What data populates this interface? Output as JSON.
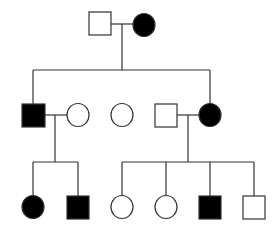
{
  "diagram": {
    "type": "pedigree",
    "colors": {
      "affected": "#000000",
      "unaffected": "#ffffff",
      "stroke": "#333333"
    },
    "generations": [
      {
        "label": "I",
        "members": [
          {
            "id": "I-1",
            "sex": "male",
            "affected": false
          },
          {
            "id": "I-2",
            "sex": "female",
            "affected": true
          }
        ]
      },
      {
        "label": "II",
        "members": [
          {
            "id": "II-1",
            "sex": "male",
            "affected": true
          },
          {
            "id": "II-2",
            "sex": "female",
            "affected": false,
            "spouse_of": "II-1"
          },
          {
            "id": "II-3",
            "sex": "female",
            "affected": false
          },
          {
            "id": "II-4",
            "sex": "male",
            "affected": false,
            "spouse_of": "II-5"
          },
          {
            "id": "II-5",
            "sex": "female",
            "affected": true
          }
        ]
      },
      {
        "label": "III",
        "members": [
          {
            "id": "III-1",
            "sex": "female",
            "affected": true,
            "parents": [
              "II-1",
              "II-2"
            ]
          },
          {
            "id": "III-2",
            "sex": "male",
            "affected": true,
            "parents": [
              "II-1",
              "II-2"
            ]
          },
          {
            "id": "III-3",
            "sex": "female",
            "affected": false,
            "parents": [
              "II-4",
              "II-5"
            ]
          },
          {
            "id": "III-4",
            "sex": "female",
            "affected": false,
            "parents": [
              "II-4",
              "II-5"
            ]
          },
          {
            "id": "III-5",
            "sex": "male",
            "affected": true,
            "parents": [
              "II-4",
              "II-5"
            ]
          },
          {
            "id": "III-6",
            "sex": "male",
            "affected": false,
            "parents": [
              "II-4",
              "II-5"
            ]
          }
        ]
      }
    ]
  }
}
